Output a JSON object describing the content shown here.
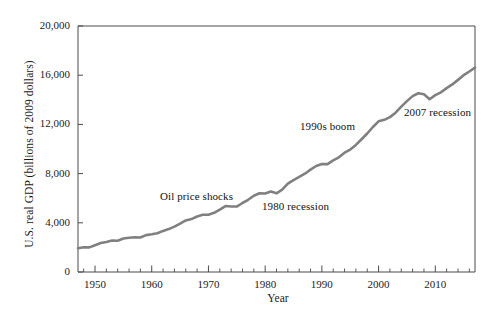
{
  "chart_data": {
    "type": "line",
    "title": "",
    "xlabel": "Year",
    "ylabel": "U.S. real GDP (billions of 2009 dollars)",
    "xlim": [
      1947,
      2017
    ],
    "ylim": [
      0,
      20000
    ],
    "grid": false,
    "legend": null,
    "line_color": "#808080",
    "xticks": [
      "1950",
      "1960",
      "1970",
      "1980",
      "1990",
      "2000",
      "2010"
    ],
    "xtick_values": [
      1950,
      1960,
      1970,
      1980,
      1990,
      2000,
      2010
    ],
    "xminor_tick_interval": 2,
    "yticks": [
      "0",
      "4,000",
      "8,000",
      "12,000",
      "16,000",
      "20,000"
    ],
    "ytick_values": [
      0,
      4000,
      8000,
      12000,
      16000,
      20000
    ],
    "series": [
      {
        "name": "U.S. real GDP",
        "x": [
          1947,
          1948,
          1949,
          1950,
          1951,
          1952,
          1953,
          1954,
          1955,
          1956,
          1957,
          1958,
          1959,
          1960,
          1961,
          1962,
          1963,
          1964,
          1965,
          1966,
          1967,
          1968,
          1969,
          1970,
          1971,
          1972,
          1973,
          1974,
          1975,
          1976,
          1977,
          1978,
          1979,
          1980,
          1981,
          1982,
          1983,
          1984,
          1985,
          1986,
          1987,
          1988,
          1989,
          1990,
          1991,
          1992,
          1993,
          1994,
          1995,
          1996,
          1997,
          1998,
          1999,
          2000,
          2001,
          2002,
          2003,
          2004,
          2005,
          2006,
          2007,
          2008,
          2009,
          2010,
          2011,
          2012,
          2013,
          2014,
          2015,
          2016,
          2017
        ],
        "values": [
          1930,
          2010,
          2000,
          2180,
          2350,
          2440,
          2560,
          2540,
          2720,
          2780,
          2830,
          2810,
          3000,
          3070,
          3150,
          3340,
          3490,
          3690,
          3930,
          4190,
          4300,
          4510,
          4650,
          4660,
          4810,
          5070,
          5360,
          5330,
          5320,
          5610,
          5870,
          6200,
          6400,
          6380,
          6540,
          6400,
          6690,
          7180,
          7470,
          7730,
          7990,
          8320,
          8620,
          8780,
          8770,
          9070,
          9320,
          9700,
          9950,
          10330,
          10790,
          11260,
          11790,
          12250,
          12370,
          12590,
          12950,
          13440,
          13890,
          14300,
          14530,
          14450,
          14050,
          14380,
          14610,
          14950,
          15250,
          15620,
          16000,
          16300,
          16620
        ]
      }
    ],
    "annotations": [
      {
        "text": "Oil price shocks",
        "x": 160,
        "y": 190
      },
      {
        "text": "1980 recession",
        "x": 262,
        "y": 200
      },
      {
        "text": "1990s boom",
        "x": 300,
        "y": 120
      },
      {
        "text": "2007 recession",
        "x": 404,
        "y": 106
      }
    ]
  }
}
